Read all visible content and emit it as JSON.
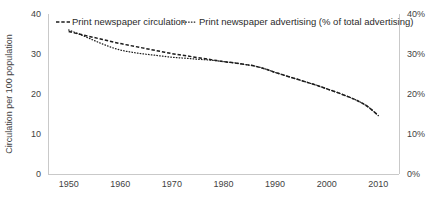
{
  "chart_data": {
    "type": "line",
    "title": "",
    "xlabel": "",
    "ylabel": "Circulation per 100 population",
    "ylabel_right": "",
    "xlim": [
      1946,
      2014
    ],
    "ylim": [
      0,
      40
    ],
    "ylim_right": [
      0,
      40
    ],
    "grid": false,
    "legend_position": "top-inside",
    "x_ticks": [
      "1950",
      "1960",
      "1970",
      "1980",
      "1990",
      "2000",
      "2010"
    ],
    "x_tick_values": [
      1950,
      1960,
      1970,
      1980,
      1990,
      2000,
      2010
    ],
    "y_ticks_left": [
      "0",
      "10",
      "20",
      "30",
      "40"
    ],
    "y_tick_values_left": [
      0,
      10,
      20,
      30,
      40
    ],
    "y_ticks_right": [
      "0%",
      "10%",
      "20%",
      "30%",
      "40%"
    ],
    "y_tick_values_right": [
      0,
      10,
      20,
      30,
      40
    ],
    "series": [
      {
        "name": "Print newspaper circulation",
        "axis": "left",
        "style": "dashed",
        "color": "#1c1c1c",
        "x": [
          1950,
          1952,
          1954,
          1956,
          1958,
          1960,
          1962,
          1964,
          1966,
          1968,
          1970,
          1972,
          1974,
          1976,
          1978,
          1980,
          1982,
          1984,
          1986,
          1988,
          1990,
          1992,
          1994,
          1996,
          1998,
          2000,
          2002,
          2004,
          2006,
          2008,
          2010
        ],
        "values": [
          35.6,
          35.0,
          34.4,
          33.8,
          33.2,
          32.6,
          32.1,
          31.6,
          31.1,
          30.6,
          30.1,
          29.7,
          29.3,
          28.9,
          28.5,
          28.1,
          27.8,
          27.4,
          27.0,
          26.3,
          25.4,
          24.6,
          23.8,
          23.0,
          22.2,
          21.3,
          20.4,
          19.4,
          18.3,
          16.8,
          14.6
        ]
      },
      {
        "name": "Print newspaper advertising (% of total advertising)",
        "axis": "right",
        "style": "dotted",
        "color": "#1c1c1c",
        "x": [
          1950,
          1952,
          1954,
          1956,
          1958,
          1960,
          1962,
          1964,
          1966,
          1968,
          1970,
          1972,
          1974,
          1976,
          1978,
          1980,
          1982,
          1984,
          1986,
          1988,
          1990,
          1992,
          1994,
          1996,
          1998,
          2000,
          2002,
          2004,
          2006,
          2008,
          2010
        ],
        "values": [
          36.0,
          35.0,
          33.9,
          32.8,
          31.8,
          31.0,
          30.5,
          30.1,
          29.8,
          29.5,
          29.2,
          29.0,
          28.8,
          28.6,
          28.4,
          28.1,
          27.8,
          27.4,
          27.0,
          26.3,
          25.4,
          24.6,
          23.8,
          23.0,
          22.2,
          21.3,
          20.4,
          19.4,
          18.3,
          16.8,
          14.6
        ]
      }
    ]
  },
  "legend": {
    "entries": [
      {
        "label": "Print newspaper circulation",
        "marker": "dashed-line-marker"
      },
      {
        "label": "Print newspaper advertising (% of total advertising)",
        "marker": "dotted-line-marker"
      }
    ]
  }
}
